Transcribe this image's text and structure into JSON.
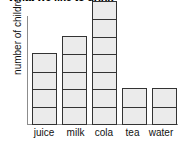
{
  "chart_data": {
    "type": "bar",
    "title": "What we like to drink",
    "xlabel": "",
    "ylabel": "number of children",
    "categories": [
      "juice",
      "milk",
      "cola",
      "tea",
      "water"
    ],
    "values": [
      4,
      5,
      7,
      2,
      2
    ],
    "ylim": [
      0,
      7
    ],
    "grid": false,
    "legend": "none",
    "style": {
      "bar_fill": "#ebebeb",
      "bar_border": "#333333",
      "axis_color": "#8c8c8c",
      "background": "#ffffff",
      "text_color": "#111111"
    }
  }
}
